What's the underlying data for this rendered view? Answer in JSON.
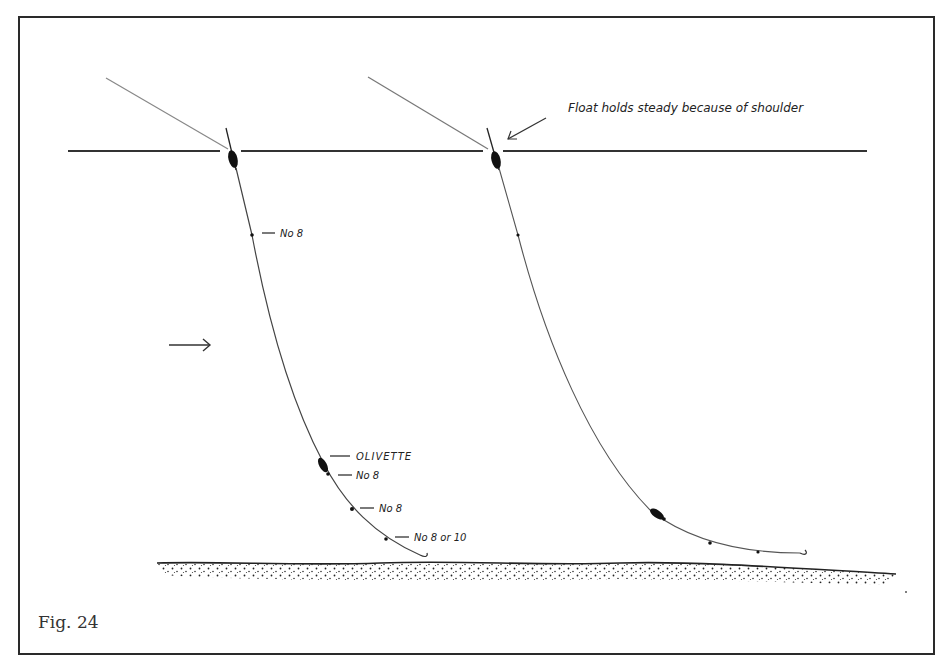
{
  "figure": {
    "caption": "Fig. 24",
    "annotation_top": "Float holds steady because of shoulder",
    "left_rig_labels": {
      "shot_top": "No 8",
      "olivette": "OLIVETTE",
      "shot_below_olivette": "No 8",
      "shot_middle": "No 8",
      "shot_bottom": "No 8 or 10"
    },
    "current_arrow": "current-direction",
    "colors": {
      "ink": "#222222",
      "frame": "#2a2a2a",
      "background": "#ffffff"
    }
  }
}
